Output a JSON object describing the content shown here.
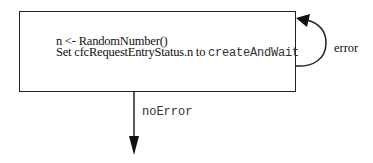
{
  "diagram": {
    "state_box": {
      "line1": "n <- RandomNumber()",
      "line2_prefix": "Set cfcRequestEntryStatus.n to ",
      "line2_value": "createAndWait"
    },
    "transitions": [
      {
        "name": "error",
        "label": "error",
        "type": "self-loop"
      },
      {
        "name": "noError",
        "label": "noError",
        "type": "exit-down"
      }
    ],
    "colors": {
      "stroke": "#222222",
      "text": "#111111",
      "mono_text": "#333333",
      "background": "#ffffff"
    }
  }
}
